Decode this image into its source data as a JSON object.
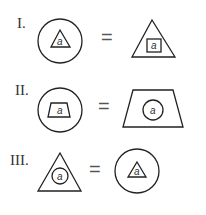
{
  "rows": [
    {
      "label": "I.",
      "left": {
        "outer": "circle",
        "inner": "triangle",
        "variable": "a"
      },
      "operator": "=",
      "right": {
        "outer": "triangle",
        "inner": "square",
        "variable": "a"
      }
    },
    {
      "label": "II.",
      "left": {
        "outer": "circle",
        "inner": "trapezoid",
        "variable": "a"
      },
      "operator": "=",
      "right": {
        "outer": "trapezoid",
        "inner": "circle",
        "variable": "a"
      }
    },
    {
      "label": "III.",
      "left": {
        "outer": "triangle",
        "inner": "circle",
        "variable": "a"
      },
      "operator": "=",
      "right": {
        "outer": "circle",
        "inner": "triangle",
        "variable": "a"
      }
    }
  ]
}
